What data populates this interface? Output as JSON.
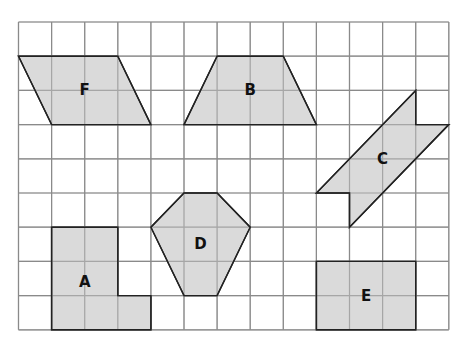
{
  "grid": {
    "cols": 13,
    "rows": 9,
    "origin_x": 18.5,
    "origin_y": 22,
    "cell_w": 33.1,
    "cell_h": 34.2,
    "line_color": "#8a8a8a",
    "background": "#ffffff"
  },
  "style": {
    "shape_fill": "#d3d3d3",
    "shape_stroke": "#222222"
  },
  "shapes": [
    {
      "label": "F",
      "points": [
        [
          0,
          1
        ],
        [
          3,
          1
        ],
        [
          4,
          3
        ],
        [
          1,
          3
        ]
      ],
      "label_pos": [
        2,
        2
      ]
    },
    {
      "label": "B",
      "points": [
        [
          6,
          1
        ],
        [
          8,
          1
        ],
        [
          9,
          3
        ],
        [
          5,
          3
        ]
      ],
      "label_pos": [
        7,
        2
      ]
    },
    {
      "label": "C",
      "points": [
        [
          12,
          2
        ],
        [
          12,
          3
        ],
        [
          13,
          3
        ],
        [
          10,
          6
        ],
        [
          10,
          5
        ],
        [
          9,
          5
        ]
      ],
      "label_pos": [
        11,
        4
      ]
    },
    {
      "label": "D",
      "points": [
        [
          5,
          5
        ],
        [
          6,
          5
        ],
        [
          7,
          6
        ],
        [
          6,
          8
        ],
        [
          5,
          8
        ],
        [
          4,
          6
        ]
      ],
      "label_pos": [
        5.5,
        6.5
      ]
    },
    {
      "label": "A",
      "points": [
        [
          1,
          6
        ],
        [
          3,
          6
        ],
        [
          3,
          8
        ],
        [
          4,
          8
        ],
        [
          4,
          9
        ],
        [
          1,
          9
        ]
      ],
      "label_pos": [
        2,
        7.6
      ]
    },
    {
      "label": "E",
      "points": [
        [
          9,
          7
        ],
        [
          12,
          7
        ],
        [
          12,
          9
        ],
        [
          9,
          9
        ]
      ],
      "label_pos": [
        10.5,
        8
      ]
    }
  ]
}
